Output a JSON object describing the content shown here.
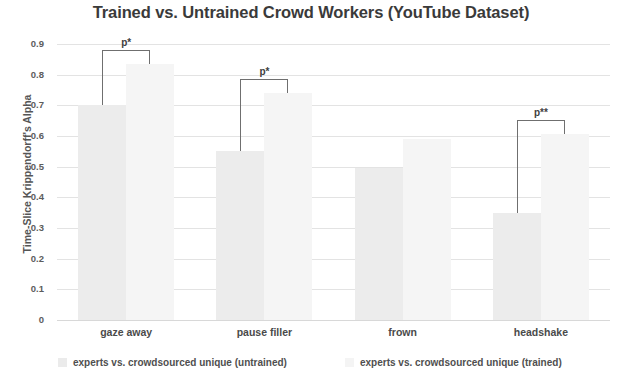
{
  "chart_data": {
    "type": "bar",
    "title": "Trained vs. Untrained Crowd Workers (YouTube Dataset)",
    "xlabel": "",
    "ylabel": "Time-Slice Krippendorff's Alpha",
    "categories": [
      "gaze away",
      "pause filler",
      "frown",
      "headshake"
    ],
    "series": [
      {
        "name": "experts vs. crowdsourced unique (untrained)",
        "color": "#ececec",
        "values": [
          0.7,
          0.55,
          0.495,
          0.35
        ]
      },
      {
        "name": "experts vs. crowdsourced unique (trained)",
        "color": "#f5f5f5",
        "values": [
          0.835,
          0.74,
          0.59,
          0.605
        ]
      }
    ],
    "ylim": [
      0,
      0.9
    ],
    "ytick_labels": [
      "0.9",
      "0.8",
      "0.7",
      "0.6",
      "0.5",
      "0.4",
      "0.3",
      "0.2",
      "0.1",
      "0"
    ],
    "ytick_values": [
      0.9,
      0.8,
      0.7,
      0.6,
      0.5,
      0.4,
      0.3,
      0.2,
      0.1,
      0
    ],
    "grid": true,
    "legend_position": "bottom",
    "annotations": [
      {
        "category": "gaze away",
        "label": "p*",
        "group_index": 0
      },
      {
        "category": "pause filler",
        "label": "p*",
        "group_index": 1
      },
      {
        "category": "headshake",
        "label": "p**",
        "group_index": 3
      }
    ]
  },
  "legend": {
    "entries": [
      {
        "label": "experts vs. crowdsourced unique (untrained)"
      },
      {
        "label": "experts vs. crowdsourced unique (trained)"
      }
    ]
  }
}
